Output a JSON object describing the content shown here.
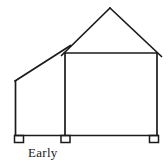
{
  "figure": {
    "kind": "architectural-elevation-line-drawing",
    "caption": "Early",
    "background_color": "#ffffff",
    "stroke_color": "#1a1a1a",
    "stroke_width": 1.6,
    "canvas": {
      "width": 168,
      "height": 166
    },
    "geometry": {
      "roof_peak": {
        "x": 110,
        "y": 8
      },
      "left_eave_wall_top": {
        "x": 15,
        "y": 81
      },
      "gable_left_corner": {
        "x": 64,
        "y": 53
      },
      "gable_right_corner": {
        "x": 157,
        "y": 53
      },
      "roof_overhang_right": {
        "x": 161,
        "y": 56
      },
      "baseline_y": 135,
      "baseline_left_x": 15,
      "baseline_right_x": 158,
      "vertical_walls": [
        {
          "name": "left-outer-wall",
          "x": 15,
          "y_top": 81,
          "y_bottom": 135
        },
        {
          "name": "center-party-wall",
          "x": 65,
          "y_top": 53,
          "y_bottom": 135
        },
        {
          "name": "right-outer-wall",
          "x": 157,
          "y_top": 53,
          "y_bottom": 135
        }
      ],
      "roof_lines": [
        {
          "name": "shed-slope-left",
          "x1": 15,
          "y1": 81,
          "x2": 70,
          "y2": 46
        },
        {
          "name": "gable-slope-left",
          "x1": 62,
          "y1": 55,
          "x2": 110,
          "y2": 8
        },
        {
          "name": "gable-slope-right",
          "x1": 110,
          "y1": 8,
          "x2": 161,
          "y2": 56
        },
        {
          "name": "eave-horizontal",
          "x1": 64,
          "y1": 53,
          "x2": 158,
          "y2": 53
        }
      ],
      "feet": [
        {
          "name": "foot-left",
          "x": 14,
          "y": 135,
          "width": 9,
          "height": 7
        },
        {
          "name": "foot-center",
          "x": 61,
          "y": 135,
          "width": 9,
          "height": 7
        },
        {
          "name": "foot-right",
          "x": 150,
          "y": 135,
          "width": 9,
          "height": 7
        }
      ]
    }
  }
}
